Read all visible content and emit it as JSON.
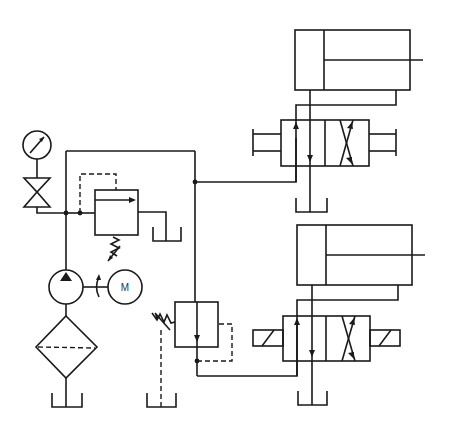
{
  "diagram": {
    "type": "hydraulic-circuit-schematic",
    "colors": {
      "line": "#1a1a1a",
      "background": "#ffffff"
    },
    "components": [
      {
        "id": "pressure-gauge",
        "label": ""
      },
      {
        "id": "shutoff-valve",
        "label": ""
      },
      {
        "id": "pressure-relief-valve",
        "label": ""
      },
      {
        "id": "hydraulic-pump",
        "label": ""
      },
      {
        "id": "electric-motor",
        "label": "M"
      },
      {
        "id": "filter",
        "label": ""
      },
      {
        "id": "sequence-valve",
        "label": ""
      },
      {
        "id": "directional-valve-1",
        "label": "",
        "actuation": "lever"
      },
      {
        "id": "directional-valve-2",
        "label": "",
        "actuation": "solenoid"
      },
      {
        "id": "cylinder-1",
        "label": ""
      },
      {
        "id": "cylinder-2",
        "label": ""
      },
      {
        "id": "tank",
        "count": 5
      }
    ],
    "motor_label": "M"
  }
}
